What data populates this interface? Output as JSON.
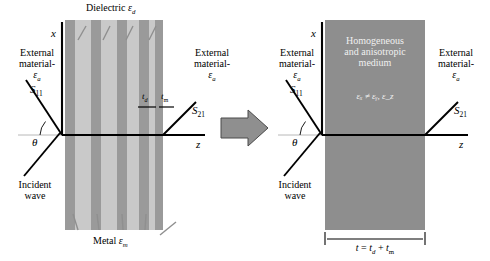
{
  "figure": {
    "colors": {
      "dielectric_stripe": "#c9c9c9",
      "metal_stripe": "#9a9a9a",
      "homogeneous_block": "#8e8e8e",
      "transition_arrow": "#8f8f8f",
      "line": "#000000",
      "in_block_text": "#f0f0f0"
    }
  },
  "left_panel": {
    "axes": {
      "vertical_label": "x",
      "horizontal_label": "z"
    },
    "top_label": {
      "text": "Dielectric ",
      "symbol": "ε",
      "subscript": "d"
    },
    "bottom_label": {
      "text": "Metal ",
      "symbol": "ε",
      "subscript": "m"
    },
    "external_left": {
      "line1": "External",
      "line2": "material-",
      "symbol": "ε",
      "subscript": "a"
    },
    "external_right": {
      "line1": "External",
      "line2": "material-",
      "symbol": "ε",
      "subscript": "a"
    },
    "scattering": {
      "reflection": "S",
      "reflection_sub": "11",
      "transmission": "S",
      "transmission_sub": "21"
    },
    "incident": {
      "line1": "Incident",
      "line2": "wave",
      "angle_symbol": "θ"
    },
    "thickness": {
      "dielectric": "t",
      "dielectric_sub": "d",
      "metal": "t",
      "metal_sub": "m"
    },
    "layer_count": 5
  },
  "right_panel": {
    "axes": {
      "vertical_label": "x",
      "horizontal_label": "z"
    },
    "medium_label": {
      "line1": "Homogeneous",
      "line2": "and anisotropic",
      "line3": "medium"
    },
    "medium_relation": "εₓ ≠ εᵧ, ε_z",
    "external_left": {
      "line1": "External",
      "line2": "material-",
      "symbol": "ε",
      "subscript": "a"
    },
    "external_right": {
      "line1": "External",
      "line2": "material-",
      "symbol": "ε",
      "subscript": "a"
    },
    "scattering": {
      "reflection": "S",
      "reflection_sub": "11",
      "transmission": "S",
      "transmission_sub": "21"
    },
    "incident": {
      "line1": "Incident",
      "line2": "wave",
      "angle_symbol": "θ"
    },
    "total_thickness": {
      "lhs": "t",
      "eq": " = ",
      "term1": "t",
      "term1_sub": "d",
      "plus": " + ",
      "term2": "t",
      "term2_sub": "m"
    }
  },
  "transition": {
    "icon": "right-block-arrow"
  }
}
